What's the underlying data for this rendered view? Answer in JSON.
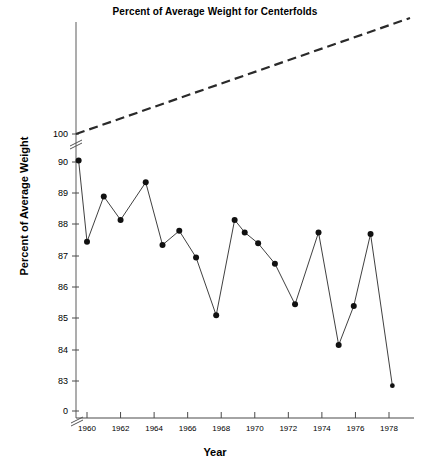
{
  "chart_data": {
    "type": "line",
    "title": "Percent of Average Weight for Centerfolds",
    "xlabel": "Year",
    "ylabel": "Percent of Average Weight",
    "grid": false,
    "legend": null,
    "xlim": [
      1959,
      1979
    ],
    "ylim": [
      82.5,
      90.5
    ],
    "y_axis_break": true,
    "y_tick_labels": [
      "100",
      "90",
      "89",
      "88",
      "87",
      "86",
      "85",
      "84",
      "83",
      "0"
    ],
    "y_ticks": [
      100,
      90,
      89,
      88,
      87,
      86,
      85,
      84,
      83,
      0
    ],
    "x_ticks": [
      1960,
      1962,
      1964,
      1966,
      1968,
      1970,
      1972,
      1974,
      1976,
      1978
    ],
    "x_tick_labels": [
      "1960",
      "1962",
      "1964",
      "1966",
      "1968",
      "1970",
      "1972",
      "1974",
      "1976",
      "1978"
    ],
    "series": [
      {
        "name": "Percent of average weight",
        "style": "solid-with-markers",
        "marker": "filled-circle",
        "x": [
          1959.5,
          1960.0,
          1961.0,
          1962.0,
          1963.0,
          1964.0,
          1965.0,
          1966.0,
          1967.0,
          1968.0,
          1969.0,
          1970.0,
          1971.0,
          1972.0,
          1973.0,
          1974.0,
          1975.0,
          1976.0,
          1977.0,
          1978.3
        ],
        "values": [
          90.05,
          87.45,
          88.9,
          88.15,
          89.35,
          87.35,
          87.8,
          86.95,
          85.1,
          88.15,
          87.75,
          87.4,
          86.75,
          85.45,
          87.75,
          84.15,
          85.4,
          87.7,
          82.85,
          82.85
        ],
        "points": [
          {
            "year": 1959.5,
            "value": 90.05
          },
          {
            "year": 1960.0,
            "value": 87.45
          },
          {
            "year": 1961.0,
            "value": 88.9
          },
          {
            "year": 1962.0,
            "value": 88.15
          },
          {
            "year": 1963.5,
            "value": 89.35
          },
          {
            "year": 1964.5,
            "value": 87.35
          },
          {
            "year": 1965.5,
            "value": 87.8
          },
          {
            "year": 1966.5,
            "value": 86.95
          },
          {
            "year": 1967.7,
            "value": 85.1
          },
          {
            "year": 1968.8,
            "value": 88.15
          },
          {
            "year": 1969.4,
            "value": 87.75
          },
          {
            "year": 1970.2,
            "value": 87.4
          },
          {
            "year": 1971.2,
            "value": 86.75
          },
          {
            "year": 1972.4,
            "value": 85.45
          },
          {
            "year": 1973.8,
            "value": 87.75
          },
          {
            "year": 1975.0,
            "value": 84.15
          },
          {
            "year": 1975.9,
            "value": 85.4
          },
          {
            "year": 1976.9,
            "value": 87.7
          },
          {
            "year": 1978.2,
            "value": 82.85
          }
        ]
      },
      {
        "name": "Reference trend",
        "style": "dashed",
        "marker": "none",
        "description": "dashed reference line rising from above 100 at left to upper right",
        "x_pixels": [
          76,
          410
        ],
        "y_pixels": [
          134,
          18
        ]
      }
    ]
  },
  "colors": {
    "line": "#2a2a2a",
    "marker": "#111111",
    "axis": "#555555",
    "text": "#000000",
    "background": "#ffffff"
  }
}
